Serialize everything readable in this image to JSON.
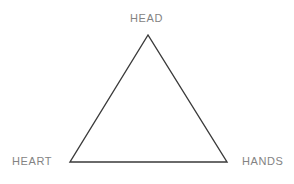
{
  "diagram": {
    "type": "triangle-diagram",
    "shape": {
      "name": "triangle",
      "stroke_color": "#3a3a3a",
      "fill_color": "none",
      "stroke_width": 1.4,
      "vertices": [
        {
          "id": "apex",
          "x": 148,
          "y": 35
        },
        {
          "id": "bottom-left",
          "x": 70,
          "y": 162
        },
        {
          "id": "bottom-right",
          "x": 227,
          "y": 162
        }
      ]
    },
    "background_color": "#ffffff",
    "label_color": "#838383",
    "labels": {
      "head": "HEAD",
      "heart": "HEART",
      "hands": "HANDS"
    }
  }
}
